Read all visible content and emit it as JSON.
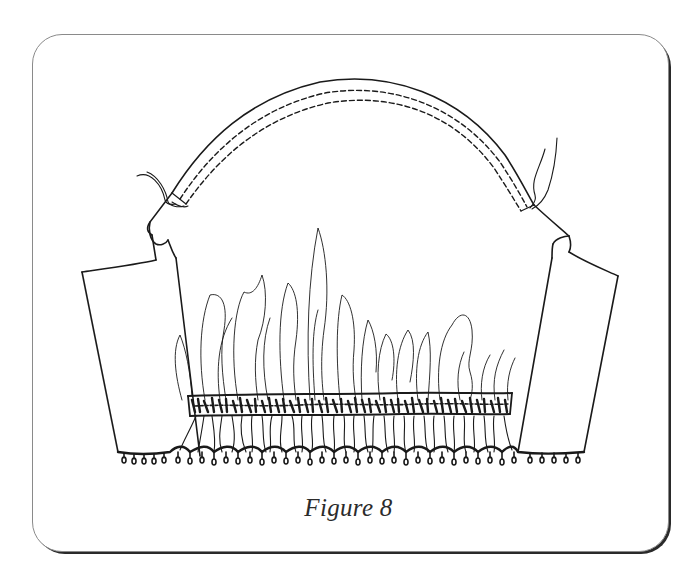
{
  "figure": {
    "caption": "Figure 8",
    "colors": {
      "ink": "#1a1a1a",
      "frame_light": "#8a8a8a",
      "frame_shadow": "#2a2a2a",
      "background": "#ffffff"
    },
    "parts": [
      "sleeve-cap-with-double-stitching",
      "thread-tails-left",
      "thread-tails-right",
      "left-folded-sleeve-panel",
      "right-folded-sleeve-panel",
      "gathered-folds",
      "elastic-casing-band",
      "lace-picot-hem"
    ]
  }
}
